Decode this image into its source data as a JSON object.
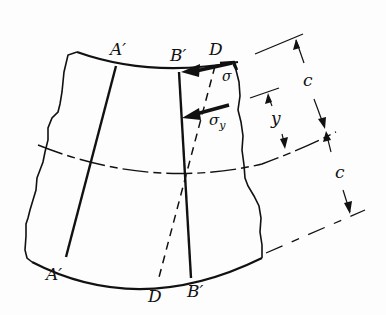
{
  "figure": {
    "labels": {
      "a_top": "A′",
      "b_top": "B′",
      "d_top": "D",
      "a_bottom": "A′",
      "d_bottom": "D",
      "b_bottom": "B′",
      "sigma": "σ",
      "sigma_y": "σ",
      "sigma_y_sub": "y",
      "y_dim": "y",
      "c_upper": "c",
      "c_lower": "c"
    },
    "colors": {
      "ink": "#111111",
      "background": "#fdfdfd"
    }
  }
}
